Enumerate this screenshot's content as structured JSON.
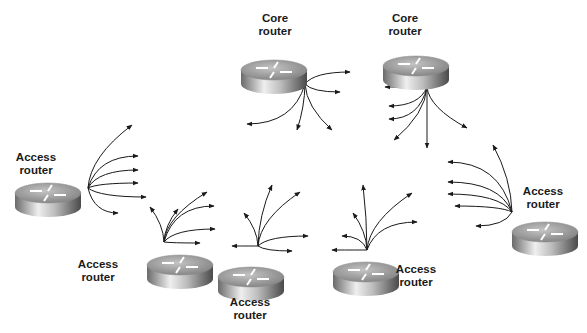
{
  "diagram": {
    "type": "network-topology",
    "routers": [
      {
        "id": "core-1",
        "role": "core",
        "label_line1": "Core",
        "label_line2": "router",
        "x": 274,
        "y": 70,
        "label_x": 240,
        "label_y": 12
      },
      {
        "id": "core-2",
        "role": "core",
        "label_line1": "Core",
        "label_line2": "router",
        "x": 416,
        "y": 66,
        "label_x": 370,
        "label_y": 12
      },
      {
        "id": "access-left",
        "role": "access",
        "label_line1": "Access",
        "label_line2": "router",
        "x": 48,
        "y": 193,
        "label_x": 1,
        "label_y": 151
      },
      {
        "id": "access-bottom-1",
        "role": "access",
        "label_line1": "Access",
        "label_line2": "router",
        "x": 180,
        "y": 265,
        "label_x": 63,
        "label_y": 258
      },
      {
        "id": "access-bottom-2",
        "role": "access",
        "label_line1": "Access",
        "label_line2": "router",
        "x": 251,
        "y": 277,
        "label_x": 215,
        "label_y": 296
      },
      {
        "id": "access-bottom-3",
        "role": "access",
        "label_line1": "Access",
        "label_line2": "router",
        "x": 366,
        "y": 272,
        "label_x": 381,
        "label_y": 263
      },
      {
        "id": "access-right",
        "role": "access",
        "label_line1": "Access",
        "label_line2": "router",
        "x": 545,
        "y": 232,
        "label_x": 508,
        "label_y": 185
      }
    ],
    "arrow_fans": [
      {
        "origin": "core-1",
        "ox": 305,
        "oy": 84,
        "targets": [
          [
            350,
            72
          ],
          [
            340,
            92
          ],
          [
            247,
            124
          ],
          [
            297,
            130
          ],
          [
            332,
            130
          ]
        ]
      },
      {
        "origin": "core-2",
        "ox": 427,
        "oy": 87,
        "targets": [
          [
            385,
            87
          ],
          [
            389,
            106
          ],
          [
            389,
            119
          ],
          [
            394,
            140
          ],
          [
            427,
            148
          ],
          [
            467,
            128
          ]
        ]
      },
      {
        "origin": "access-left",
        "ox": 88,
        "oy": 188,
        "targets": [
          [
            132,
            125
          ],
          [
            138,
            156
          ],
          [
            138,
            170
          ],
          [
            138,
            183
          ],
          [
            146,
            197
          ],
          [
            118,
            213
          ]
        ]
      },
      {
        "origin": "access-bottom-1",
        "ox": 164,
        "oy": 242,
        "targets": [
          [
            150,
            207
          ],
          [
            178,
            209
          ],
          [
            207,
            192
          ],
          [
            214,
            206
          ],
          [
            215,
            229
          ],
          [
            200,
            243
          ]
        ]
      },
      {
        "origin": "access-bottom-2",
        "ox": 258,
        "oy": 246,
        "targets": [
          [
            232,
            246
          ],
          [
            244,
            213
          ],
          [
            272,
            185
          ],
          [
            300,
            192
          ],
          [
            308,
            236
          ],
          [
            292,
            251
          ]
        ]
      },
      {
        "origin": "access-bottom-3",
        "ox": 367,
        "oy": 250,
        "targets": [
          [
            332,
            250
          ],
          [
            342,
            236
          ],
          [
            353,
            213
          ],
          [
            363,
            185
          ],
          [
            412,
            193
          ],
          [
            417,
            222
          ]
        ]
      },
      {
        "origin": "access-right",
        "ox": 512,
        "oy": 212,
        "targets": [
          [
            493,
            145
          ],
          [
            448,
            162
          ],
          [
            448,
            182
          ],
          [
            448,
            194
          ],
          [
            455,
            206
          ],
          [
            476,
            226
          ]
        ]
      }
    ],
    "colors": {
      "background": "#ffffff",
      "arrow": "#1a1a1a",
      "label": "#1a1a1a",
      "router_top": "#a7a7a7",
      "router_side_light": "#e8e8e8",
      "router_side_dark": "#555555"
    }
  }
}
